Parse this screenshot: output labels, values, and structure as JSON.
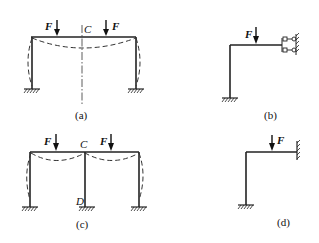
{
  "figure": {
    "panels": [
      {
        "id": "a",
        "caption": "(a)",
        "description": "Symmetric portal frame, two downward loads F, deflected shape dashed, symmetry axis through C",
        "load_label": "F",
        "point_labels": [
          "C"
        ]
      },
      {
        "id": "b",
        "caption": "(b)",
        "description": "Half frame with fixed base and sliding (guided) support at right end of beam, load F",
        "load_label": "F",
        "point_labels": []
      },
      {
        "id": "c",
        "caption": "(c)",
        "description": "Two-bay frame with middle column CD, two downward loads F, deflected shape dashed",
        "load_label": "F",
        "point_labels": [
          "C",
          "D"
        ]
      },
      {
        "id": "d",
        "caption": "(d)",
        "description": "Half frame with fixed base and fixed support at right end of beam, load F",
        "load_label": "F",
        "point_labels": []
      }
    ]
  },
  "labels": {
    "F": "F",
    "C": "C",
    "D": "D",
    "cap_a": "(a)",
    "cap_b": "(b)",
    "cap_c": "(c)",
    "cap_d": "(d)"
  },
  "colors": {
    "line": "#222222",
    "background": "#ffffff"
  }
}
